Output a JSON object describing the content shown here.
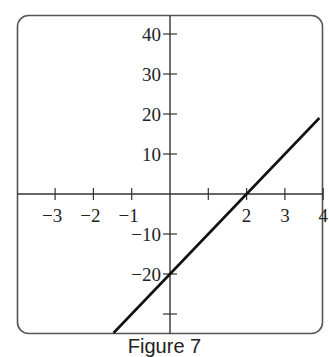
{
  "caption": "Figure 7",
  "chart_data": {
    "type": "line",
    "title": "",
    "xlabel": "",
    "ylabel": "",
    "xlim": [
      -4.1,
      4.0
    ],
    "ylim": [
      -35,
      45
    ],
    "grid": false,
    "legend": null,
    "x_ticks": [
      -3,
      -2,
      -1,
      1,
      2,
      3,
      4
    ],
    "x_tick_labels": [
      "−3",
      "−2",
      "−1",
      "",
      "2",
      "3",
      "4"
    ],
    "y_ticks": [
      40,
      30,
      20,
      10,
      -10,
      -20,
      -30
    ],
    "y_tick_labels": [
      "40",
      "30",
      "20",
      "10",
      "−10",
      "−20",
      ""
    ],
    "series": [
      {
        "name": "y = 10x - 20",
        "equation": "y = 10x - 20",
        "x": [
          -1.475,
          0,
          2,
          3.9
        ],
        "y": [
          -34.75,
          -20,
          0,
          19
        ]
      }
    ],
    "colors": {
      "line": "#111111",
      "axes": "#333333",
      "frame": "#555555"
    }
  }
}
